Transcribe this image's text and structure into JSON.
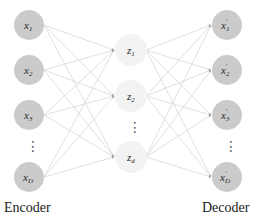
{
  "diagram": {
    "type": "autoencoder",
    "colors": {
      "io_node_fill": "#cbcbcb",
      "latent_node_fill": "#f3f3f3",
      "edge": "#d2d2d2",
      "arrow": "#a8a8a8",
      "text": "#222222"
    },
    "encoder": {
      "caption": "Encoder",
      "nodes": [
        {
          "base": "x",
          "sub": "1",
          "prime": ""
        },
        {
          "base": "x",
          "sub": "2",
          "prime": ""
        },
        {
          "base": "x",
          "sub": "3",
          "prime": ""
        },
        {
          "base": "x",
          "sub": "D",
          "prime": ""
        }
      ]
    },
    "latent": {
      "nodes": [
        {
          "base": "z",
          "sub": "1"
        },
        {
          "base": "z",
          "sub": "2"
        },
        {
          "base": "z",
          "sub": "d"
        }
      ]
    },
    "decoder": {
      "caption": "Decoder",
      "nodes": [
        {
          "base": "x",
          "sub": "1",
          "prime": "′"
        },
        {
          "base": "x",
          "sub": "2",
          "prime": "′"
        },
        {
          "base": "x",
          "sub": "3",
          "prime": "′"
        },
        {
          "base": "x",
          "sub": "D",
          "prime": "′"
        }
      ]
    },
    "ellipsis": "⋮"
  }
}
